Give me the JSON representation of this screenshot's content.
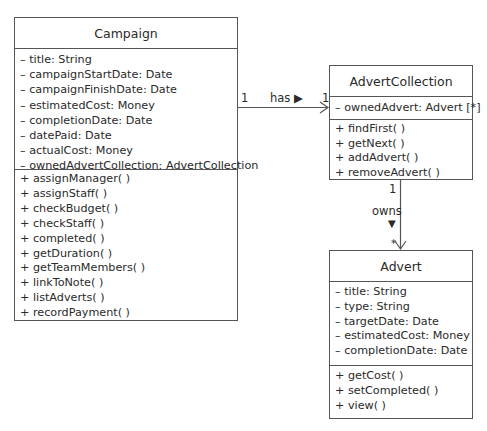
{
  "classes": {
    "campaign": {
      "name": "Campaign",
      "attributes": [
        "– title: String",
        "– campaignStartDate: Date",
        "– campaignFinishDate: Date",
        "– estimatedCost: Money",
        "– completionDate: Date",
        "– datePaid: Date",
        "– actualCost: Money",
        "– ownedAdvertCollection: AdvertCollection"
      ],
      "operations": [
        "+ assignManager( )",
        "+ assignStaff( )",
        "+ checkBudget( )",
        "+ checkStaff( )",
        "+ completed( )",
        "+ getDuration( )",
        "+ getTeamMembers( )",
        "+ linkToNote( )",
        "+ listAdverts( )",
        "+ recordPayment( )"
      ]
    },
    "advert_collection": {
      "name": "AdvertCollection",
      "attributes": [
        "– ownedAdvert: Advert [*]"
      ],
      "operations": [
        "+ findFirst( )",
        "+ getNext( )",
        "+ addAdvert( )",
        "+ removeAdvert( )"
      ]
    },
    "advert": {
      "name": "Advert",
      "attributes": [
        "– title: String",
        "– type: String",
        "– targetDate: Date",
        "– estimatedCost: Money",
        "– completionDate: Date"
      ],
      "operations": [
        "+ getCost( )",
        "+ setCompleted( )",
        "+ view( )"
      ]
    }
  },
  "associations": {
    "has": {
      "label": "has ▶",
      "source_multiplicity": "1",
      "target_multiplicity": "1"
    },
    "owns": {
      "label": "owns",
      "direction_glyph": "▼",
      "source_multiplicity": "1",
      "target_multiplicity": "*"
    }
  }
}
